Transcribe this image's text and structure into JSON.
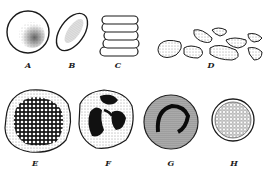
{
  "figure": {
    "ink_color": "#1a1a1a",
    "background": "#ffffff",
    "panels": [
      {
        "id": "A",
        "label": "A",
        "x": 28,
        "y": 67
      },
      {
        "id": "B",
        "label": "B",
        "x": 72,
        "y": 67
      },
      {
        "id": "C",
        "label": "C",
        "x": 118,
        "y": 67
      },
      {
        "id": "D",
        "label": "D",
        "x": 210,
        "y": 66
      },
      {
        "id": "E",
        "label": "E",
        "x": 34,
        "y": 160
      },
      {
        "id": "F",
        "label": "F",
        "x": 107,
        "y": 160
      },
      {
        "id": "G",
        "label": "G",
        "x": 172,
        "y": 160
      },
      {
        "id": "H",
        "label": "H",
        "x": 234,
        "y": 160
      }
    ]
  }
}
